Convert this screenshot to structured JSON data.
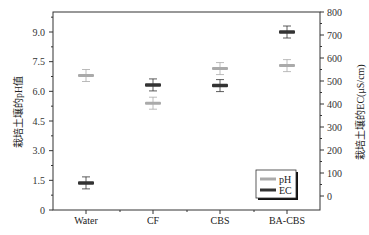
{
  "chart_data": {
    "type": "scatter",
    "title": "",
    "categories": [
      "Water",
      "CF",
      "CBS",
      "BA-CBS"
    ],
    "series": [
      {
        "name": "pH",
        "axis": "left",
        "color": "#aaaaaa",
        "values": [
          6.8,
          5.4,
          7.15,
          7.3
        ]
      },
      {
        "name": "EC",
        "axis": "right",
        "color": "#333333",
        "values": [
          57,
          483,
          480,
          713
        ]
      }
    ],
    "ylabel_left": "栽培土壤的pH值",
    "ylabel_right": "栽培土壤的EC(μS/cm)",
    "yticks_left": [
      "0",
      "1.5",
      "3.0",
      "4.5",
      "6.0",
      "7.5",
      "9.0"
    ],
    "yticks_right": [
      "0",
      "100",
      "200",
      "300",
      "400",
      "500",
      "600",
      "700",
      "800"
    ],
    "ylim_left": [
      0,
      10
    ],
    "ylim_right": [
      -60,
      800
    ],
    "legend": {
      "position": "lower right",
      "entries": [
        "pH",
        "EC"
      ]
    },
    "grid": false
  }
}
